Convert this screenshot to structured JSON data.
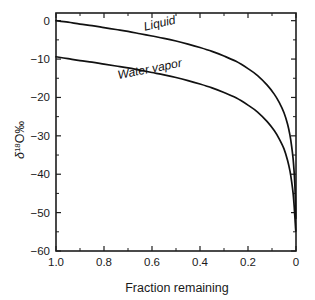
{
  "chart_data": {
    "type": "line",
    "title": "",
    "xlabel": "Fraction remaining",
    "ylabel": "δ 18 O ‰",
    "ylabel_parts": {
      "delta": "δ",
      "mass": "18",
      "element": "O",
      "permil": "‰"
    },
    "xlim": [
      1.0,
      0.0
    ],
    "ylim": [
      -60,
      2
    ],
    "x_reversed": true,
    "grid": false,
    "legend_position": "inline-annotation",
    "xticks": [
      1.0,
      0.8,
      0.6,
      0.4,
      0.2,
      0.0
    ],
    "xtick_labels": [
      "1.0",
      "0.8",
      "0.6",
      "0.4",
      "0.2",
      "0"
    ],
    "xticks_minor": [
      0.9,
      0.7,
      0.5,
      0.3,
      0.1
    ],
    "yticks": [
      0,
      -10,
      -20,
      -30,
      -40,
      -50,
      -60
    ],
    "ytick_labels": [
      "0",
      "−10",
      "−20",
      "−30",
      "−40",
      "−50",
      "−60"
    ],
    "yticks_minor": [
      -5,
      -15,
      -25,
      -35,
      -45,
      -55
    ],
    "series": [
      {
        "name": "Liquid",
        "label": "Liquid",
        "color": "#111111",
        "x": [
          1.0,
          0.95,
          0.9,
          0.85,
          0.8,
          0.75,
          0.7,
          0.65,
          0.6,
          0.55,
          0.5,
          0.45,
          0.4,
          0.35,
          0.3,
          0.25,
          0.2,
          0.16,
          0.12,
          0.09,
          0.07,
          0.05,
          0.035,
          0.025,
          0.018,
          0.012,
          0.008,
          0.005,
          0.003,
          0.002,
          0.001
        ],
        "values": [
          0.0,
          -0.4,
          -0.9,
          -1.3,
          -1.8,
          -2.3,
          -2.8,
          -3.4,
          -4.0,
          -4.6,
          -5.3,
          -6.1,
          -7.0,
          -8.0,
          -9.2,
          -10.6,
          -12.5,
          -14.3,
          -16.8,
          -19.2,
          -21.3,
          -24.0,
          -27.0,
          -29.9,
          -32.8,
          -36.0,
          -39.2,
          -42.5,
          -45.8,
          -48.4,
          -51.5
        ]
      },
      {
        "name": "Water vapor",
        "label": "Water vapor",
        "color": "#111111",
        "x": [
          1.0,
          0.95,
          0.9,
          0.85,
          0.8,
          0.75,
          0.7,
          0.65,
          0.6,
          0.55,
          0.5,
          0.45,
          0.4,
          0.35,
          0.3,
          0.25,
          0.2,
          0.16,
          0.12,
          0.09,
          0.07,
          0.05,
          0.035,
          0.025,
          0.018,
          0.012,
          0.008,
          0.005,
          0.003,
          0.002,
          0.001
        ],
        "values": [
          -9.4,
          -9.9,
          -10.4,
          -10.8,
          -11.3,
          -11.8,
          -12.3,
          -12.9,
          -13.5,
          -14.1,
          -14.8,
          -15.6,
          -16.5,
          -17.5,
          -18.7,
          -20.1,
          -22.0,
          -23.8,
          -26.3,
          -28.7,
          -30.8,
          -33.4,
          -36.4,
          -39.2,
          -42.0,
          -45.0,
          -48.0,
          -50.8,
          -52.8,
          -53.9,
          -54.8
        ]
      }
    ],
    "annotations": [
      {
        "text": "Liquid",
        "x": 0.63,
        "y": -2.6,
        "rotation": -13
      },
      {
        "text": "Water vapor",
        "x": 0.74,
        "y": -15.2,
        "rotation": -11
      }
    ]
  }
}
